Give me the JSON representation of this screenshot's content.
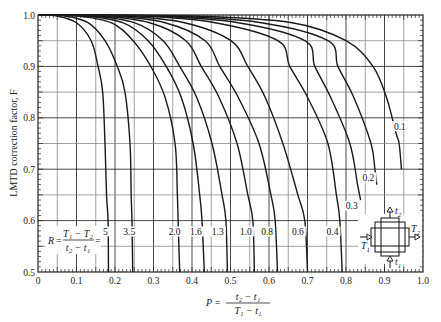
{
  "chart_data": {
    "type": "line",
    "title": "",
    "xlabel": "P = (t2 − t1) / (T1 − t1)",
    "ylabel": "LMTD correction factor, F",
    "xlim": [
      0,
      1.0
    ],
    "ylim": [
      0.5,
      1.0
    ],
    "grid": true,
    "x_ticks": [
      "0",
      "0.1",
      "0.2",
      "0.3",
      "0.4",
      "0.5",
      "0.6",
      "0.7",
      "0.8",
      "0.9",
      "1.0"
    ],
    "y_ticks": [
      "0.5",
      "0.6",
      "0.7",
      "0.8",
      "0.9",
      "1.0"
    ],
    "parameter_label": "R = (T1 − T2) / (t2 − t1) =",
    "series": [
      {
        "name": "5",
        "label": "5",
        "points": [
          [
            0,
            1.0
          ],
          [
            0.05,
            0.998
          ],
          [
            0.1,
            0.985
          ],
          [
            0.138,
            0.95
          ],
          [
            0.156,
            0.9
          ],
          [
            0.168,
            0.85
          ],
          [
            0.174,
            0.75
          ],
          [
            0.178,
            0.65
          ],
          [
            0.182,
            0.6
          ],
          [
            0.183,
            0.5
          ]
        ],
        "label_pos": [
          0.175,
          0.575
        ]
      },
      {
        "name": "3.5",
        "label": "3.5",
        "points": [
          [
            0,
            1.0
          ],
          [
            0.07,
            0.998
          ],
          [
            0.13,
            0.985
          ],
          [
            0.174,
            0.95
          ],
          [
            0.206,
            0.9
          ],
          [
            0.226,
            0.85
          ],
          [
            0.239,
            0.75
          ],
          [
            0.242,
            0.65
          ],
          [
            0.244,
            0.6
          ],
          [
            0.246,
            0.5
          ]
        ],
        "label_pos": [
          0.237,
          0.575
        ]
      },
      {
        "name": "2.0",
        "label": "2.0",
        "points": [
          [
            0,
            1.0
          ],
          [
            0.1,
            0.998
          ],
          [
            0.19,
            0.985
          ],
          [
            0.247,
            0.95
          ],
          [
            0.293,
            0.9
          ],
          [
            0.33,
            0.84
          ],
          [
            0.356,
            0.75
          ],
          [
            0.362,
            0.65
          ],
          [
            0.364,
            0.6
          ],
          [
            0.368,
            0.5
          ]
        ],
        "label_pos": [
          0.355,
          0.575
        ]
      },
      {
        "name": "1.6",
        "label": "1.6",
        "points": [
          [
            0,
            1.0
          ],
          [
            0.12,
            0.998
          ],
          [
            0.22,
            0.985
          ],
          [
            0.286,
            0.95
          ],
          [
            0.333,
            0.9
          ],
          [
            0.372,
            0.84
          ],
          [
            0.403,
            0.75
          ],
          [
            0.42,
            0.65
          ],
          [
            0.426,
            0.6
          ],
          [
            0.432,
            0.5
          ]
        ],
        "label_pos": [
          0.41,
          0.575
        ]
      },
      {
        "name": "1.3",
        "label": "1.3",
        "points": [
          [
            0,
            1.0
          ],
          [
            0.14,
            0.998
          ],
          [
            0.25,
            0.985
          ],
          [
            0.325,
            0.95
          ],
          [
            0.368,
            0.9
          ],
          [
            0.412,
            0.84
          ],
          [
            0.452,
            0.75
          ],
          [
            0.478,
            0.65
          ],
          [
            0.488,
            0.6
          ],
          [
            0.492,
            0.5
          ]
        ],
        "label_pos": [
          0.467,
          0.575
        ]
      },
      {
        "name": "1.0",
        "label": "1.0",
        "points": [
          [
            0,
            1.0
          ],
          [
            0.16,
            0.998
          ],
          [
            0.29,
            0.985
          ],
          [
            0.384,
            0.95
          ],
          [
            0.424,
            0.9
          ],
          [
            0.47,
            0.84
          ],
          [
            0.517,
            0.75
          ],
          [
            0.545,
            0.65
          ],
          [
            0.558,
            0.6
          ],
          [
            0.562,
            0.5
          ]
        ],
        "label_pos": [
          0.54,
          0.575
        ]
      },
      {
        "name": "0.8",
        "label": "0.8",
        "points": [
          [
            0,
            1.0
          ],
          [
            0.19,
            0.998
          ],
          [
            0.33,
            0.985
          ],
          [
            0.434,
            0.95
          ],
          [
            0.472,
            0.9
          ],
          [
            0.52,
            0.84
          ],
          [
            0.574,
            0.75
          ],
          [
            0.605,
            0.65
          ],
          [
            0.616,
            0.6
          ],
          [
            0.622,
            0.5
          ]
        ],
        "label_pos": [
          0.595,
          0.575
        ]
      },
      {
        "name": "0.6",
        "label": "0.6",
        "points": [
          [
            0,
            1.0
          ],
          [
            0.22,
            0.998
          ],
          [
            0.38,
            0.985
          ],
          [
            0.501,
            0.95
          ],
          [
            0.545,
            0.9
          ],
          [
            0.59,
            0.84
          ],
          [
            0.636,
            0.75
          ],
          [
            0.675,
            0.65
          ],
          [
            0.693,
            0.6
          ],
          [
            0.7,
            0.5
          ]
        ],
        "label_pos": [
          0.675,
          0.575
        ]
      },
      {
        "name": "0.4",
        "label": "0.4",
        "points": [
          [
            0,
            1.0
          ],
          [
            0.27,
            0.998
          ],
          [
            0.46,
            0.985
          ],
          [
            0.623,
            0.95
          ],
          [
            0.654,
            0.9
          ],
          [
            0.7,
            0.84
          ],
          [
            0.753,
            0.75
          ],
          [
            0.775,
            0.65
          ],
          [
            0.784,
            0.6
          ],
          [
            0.79,
            0.5
          ]
        ],
        "label_pos": [
          0.765,
          0.575
        ]
      },
      {
        "name": "0.3",
        "label": "0.3",
        "points": [
          [
            0,
            1.0
          ],
          [
            0.3,
            0.998
          ],
          [
            0.52,
            0.985
          ],
          [
            0.693,
            0.95
          ],
          [
            0.719,
            0.9
          ],
          [
            0.76,
            0.84
          ],
          [
            0.81,
            0.75
          ],
          [
            0.83,
            0.67
          ],
          [
            0.838,
            0.64
          ]
        ],
        "label_pos": [
          0.815,
          0.625
        ]
      },
      {
        "name": "0.2",
        "label": "0.2",
        "points": [
          [
            0,
            1.0
          ],
          [
            0.34,
            0.998
          ],
          [
            0.58,
            0.985
          ],
          [
            0.753,
            0.95
          ],
          [
            0.779,
            0.9
          ],
          [
            0.82,
            0.84
          ],
          [
            0.865,
            0.75
          ],
          [
            0.875,
            0.7
          ],
          [
            0.88,
            0.67
          ]
        ],
        "label_pos": [
          0.858,
          0.68
        ]
      },
      {
        "name": "0.1",
        "label": "0.1",
        "points": [
          [
            0,
            1.0
          ],
          [
            0.4,
            0.998
          ],
          [
            0.66,
            0.985
          ],
          [
            0.8,
            0.95
          ],
          [
            0.87,
            0.9
          ],
          [
            0.905,
            0.84
          ],
          [
            0.93,
            0.77
          ],
          [
            0.938,
            0.75
          ],
          [
            0.944,
            0.7
          ]
        ],
        "label_pos": [
          0.94,
          0.78
        ]
      }
    ],
    "annotations": [
      {
        "text": "R = (T1 − T2)/(t2 − t1) =",
        "position": "bottom-left, F≈0.575"
      },
      {
        "text": "Heat exchanger flow schematic: T1 in (left), T2 out (right), t1 in (bottom), t2 out (top)",
        "position": "bottom-right"
      }
    ]
  },
  "labels": {
    "ylabel": "LMTD correction factor, F",
    "xlabel_P": "P",
    "xlabel_eq": "=",
    "xlabel_num": "t₂ − t₁",
    "xlabel_den": "T₁ − t₁",
    "R_lhs": "R",
    "R_eq": "=",
    "R_num": "T₁ − T₂",
    "R_den": "t₂ − t₁",
    "R_tail": "=",
    "schematic_T1": "T",
    "schematic_T1_sub": "1",
    "schematic_T2": "T",
    "schematic_T2_sub": "2",
    "schematic_t1": "t",
    "schematic_t1_sub": "1",
    "schematic_t2": "t",
    "schematic_t2_sub": "2"
  },
  "colors": {
    "curve": "#1a1a1a",
    "grid_major": "#333333",
    "grid_minor": "#8a8a8a",
    "axis": "#222222"
  }
}
